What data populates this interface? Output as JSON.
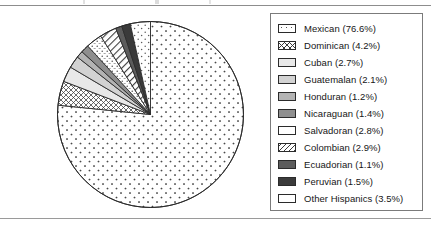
{
  "page": {
    "background_color": "#ffffff",
    "rule_color": "#8d8d8d"
  },
  "legend": {
    "border_color": "#7b7b7b",
    "items": [
      {
        "label": "Mexican (76.6%)",
        "name": "Mexican",
        "value": 76.6,
        "pattern": "sparse-dots",
        "swatch_class": "p-dots-sparse"
      },
      {
        "label": "Dominican (4.2%)",
        "name": "Dominican",
        "value": 4.2,
        "pattern": "crosshatch",
        "swatch_class": "p-crosshatch"
      },
      {
        "label": "Cuban (2.7%)",
        "name": "Cuban",
        "value": 2.7,
        "pattern": "light-gray",
        "swatch_class": "p-gray-lightest"
      },
      {
        "label": "Guatemalan (2.1%)",
        "name": "Guatemalan",
        "value": 2.1,
        "pattern": "gray",
        "swatch_class": "p-gray-light"
      },
      {
        "label": "Honduran (1.2%)",
        "name": "Honduran",
        "value": 1.2,
        "pattern": "mid-gray",
        "swatch_class": "p-gray-mid"
      },
      {
        "label": "Nicaraguan (1.4%)",
        "name": "Nicaraguan",
        "value": 1.4,
        "pattern": "dark-gray",
        "swatch_class": "p-gray-dark"
      },
      {
        "label": "Salvadoran (2.8%)",
        "name": "Salvadoran",
        "value": 2.8,
        "pattern": "dot-dash",
        "swatch_class": "p-dotdash"
      },
      {
        "label": "Colombian (2.9%)",
        "name": "Colombian",
        "value": 2.9,
        "pattern": "diagonal-lines",
        "swatch_class": "p-diag"
      },
      {
        "label": "Ecuadorian (1.1%)",
        "name": "Ecuadorian",
        "value": 1.1,
        "pattern": "charcoal",
        "swatch_class": "p-charcoal"
      },
      {
        "label": "Peruvian (1.5%)",
        "name": "Peruvian",
        "value": 1.5,
        "pattern": "near-black",
        "swatch_class": "p-near-black"
      },
      {
        "label": "Other Hispanics (3.5%)",
        "name": "Other Hispanics",
        "value": 3.5,
        "pattern": "white-dots",
        "swatch_class": "p-white-dots"
      }
    ]
  },
  "chart_data": {
    "type": "pie",
    "title": "",
    "units": "percent",
    "start_angle_deg": 0,
    "direction": "clockwise",
    "center_px": [
      94.5,
      94.5
    ],
    "radius_px": 93,
    "legend_position": "right",
    "categories": [
      "Mexican",
      "Dominican",
      "Cuban",
      "Guatemalan",
      "Honduran",
      "Nicaraguan",
      "Salvadoran",
      "Colombian",
      "Ecuadorian",
      "Peruvian",
      "Other Hispanics"
    ],
    "values": [
      76.6,
      4.2,
      2.7,
      2.1,
      1.2,
      1.4,
      2.8,
      2.9,
      1.1,
      1.5,
      3.5
    ],
    "labels": [
      "Mexican (76.6%)",
      "Dominican (4.2%)",
      "Cuban (2.7%)",
      "Guatemalan (2.1%)",
      "Honduran (1.2%)",
      "Nicaraguan (1.4%)",
      "Salvadoran (2.8%)",
      "Colombian (2.9%)",
      "Ecuadorian (1.1%)",
      "Peruvian (1.5%)",
      "Other Hispanics (3.5%)"
    ],
    "slice_patterns": [
      "sparse-dots",
      "crosshatch",
      "light-gray",
      "gray",
      "mid-gray",
      "dark-gray",
      "dot-dash",
      "diagonal-lines",
      "charcoal",
      "near-black",
      "white-dots"
    ],
    "slice_order_clockwise_from_top": [
      "Mexican",
      "Dominican",
      "Cuban",
      "Guatemalan",
      "Honduran",
      "Nicaraguan",
      "Salvadoran",
      "Colombian",
      "Ecuadorian",
      "Peruvian",
      "Other Hispanics"
    ],
    "total": 100.0,
    "outline_color": "#2b2b2b"
  }
}
